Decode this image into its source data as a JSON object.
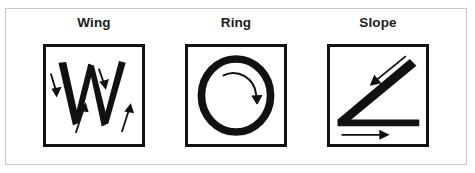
{
  "figure": {
    "background_color": "#ffffff",
    "frame_border_color": "#c9c9c9",
    "stroke_color": "#111111",
    "label_color": "#1c1c1c",
    "panel_count": 3
  },
  "panels": [
    {
      "label": "Wing",
      "glyph": "W",
      "icon_name": "wing-stroke-diagram",
      "description": "Letter W drawn with four stroke-direction arrows",
      "strokes": [
        {
          "index": 1,
          "direction": "down-left",
          "arrow": "down-left-arrow"
        },
        {
          "index": 2,
          "direction": "up-right",
          "arrow": "up-right-arrow"
        },
        {
          "index": 3,
          "direction": "down-right",
          "arrow": "down-right-arrow"
        },
        {
          "index": 4,
          "direction": "up-right",
          "arrow": "up-right-arrow"
        }
      ],
      "arrow_count": 4
    },
    {
      "label": "Ring",
      "glyph": "O",
      "icon_name": "ring-stroke-diagram",
      "description": "Circle drawn with a single clockwise curved arrow",
      "strokes": [
        {
          "index": 1,
          "direction": "clockwise",
          "arrow": "clockwise-curved-arrow"
        }
      ],
      "arrow_count": 1
    },
    {
      "label": "Slope",
      "glyph": "L",
      "icon_name": "slope-stroke-diagram",
      "description": "Diagonal stroke down-left then horizontal stroke to the right",
      "strokes": [
        {
          "index": 1,
          "direction": "down-left",
          "arrow": "down-left-arrow"
        },
        {
          "index": 2,
          "direction": "right",
          "arrow": "right-arrow"
        }
      ],
      "arrow_count": 2
    }
  ]
}
